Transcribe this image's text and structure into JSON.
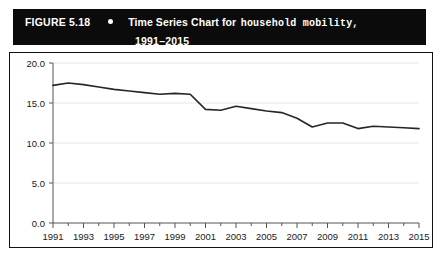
{
  "figure": {
    "number_label": "FIGURE 5.18",
    "bullet_icon": "bullet-dot-icon",
    "title_sans": "Time Series Chart for",
    "title_mono": "household mobility,",
    "title_years": "1991–2015"
  },
  "colors": {
    "title_bar_background": "#0b0b0b",
    "title_text": "#ffffff",
    "chart_border": "#111111",
    "plot_background": "#ffffff",
    "line": "#262626",
    "gridline": "#e6e6e6",
    "axis": "#555555",
    "tick_text": "#1b1b1b"
  },
  "chart_data": {
    "type": "line",
    "title": "Time Series Chart for household mobility, 1991–2015",
    "xlabel": "",
    "ylabel": "",
    "xlim": [
      1991,
      2015
    ],
    "ylim": [
      0.0,
      20.0
    ],
    "grid": true,
    "legend": "none",
    "y_ticks": [
      0.0,
      5.0,
      10.0,
      15.0,
      20.0
    ],
    "y_tick_labels": [
      "0.0",
      "5.0",
      "10.0",
      "15.0",
      "20.0"
    ],
    "x_ticks": [
      1991,
      1992,
      1993,
      1994,
      1995,
      1996,
      1997,
      1998,
      1999,
      2000,
      2001,
      2002,
      2003,
      2004,
      2005,
      2006,
      2007,
      2008,
      2009,
      2010,
      2011,
      2012,
      2013,
      2014,
      2015
    ],
    "x_tick_labels": [
      "1991",
      "",
      "1993",
      "",
      "1995",
      "",
      "1997",
      "",
      "1999",
      "",
      "2001",
      "",
      "2003",
      "",
      "2005",
      "",
      "2007",
      "",
      "2009",
      "",
      "2011",
      "",
      "2013",
      "",
      "2015"
    ],
    "x": [
      1991,
      1992,
      1993,
      1994,
      1995,
      1996,
      1997,
      1998,
      1999,
      2000,
      2001,
      2002,
      2003,
      2004,
      2005,
      2006,
      2007,
      2008,
      2009,
      2010,
      2011,
      2012,
      2013,
      2014,
      2015
    ],
    "series": [
      {
        "name": "household mobility",
        "values": [
          17.2,
          17.5,
          17.3,
          17.0,
          16.7,
          16.5,
          16.3,
          16.1,
          16.2,
          16.1,
          14.2,
          14.1,
          14.6,
          14.3,
          14.0,
          13.8,
          13.1,
          12.0,
          12.5,
          12.5,
          11.8,
          12.1,
          12.0,
          11.9,
          11.8
        ]
      }
    ]
  }
}
